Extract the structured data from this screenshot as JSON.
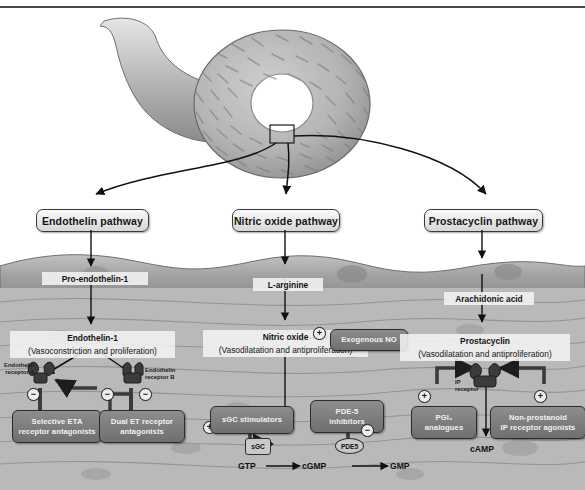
{
  "figure": {
    "vessel_label": "pulmonary artery cross-section"
  },
  "pathways": [
    {
      "id": "endothelin",
      "header": "Endothelin pathway",
      "precursor": "Pro-endothelin-1",
      "mediator_name": "Endothelin-1",
      "mediator_effect": "(Vasoconstriction and proliferation)",
      "receptors": [
        {
          "label_line1": "Endothelin",
          "label_line2": "receptor A"
        },
        {
          "label_line1": "Endothelin",
          "label_line2": "receptor B"
        }
      ],
      "drugs": [
        {
          "line1": "Selective ETA",
          "line2": "receptor antagonists",
          "sign": "−"
        },
        {
          "line1": "Dual ET receptor",
          "line2": "antagonists",
          "sign": "−"
        }
      ]
    },
    {
      "id": "nitric-oxide",
      "header": "Nitric oxide pathway",
      "precursor": "L-arginine",
      "mediator_name": "Nitric oxide",
      "mediator_effect": "(Vasodilatation and antiproliferation)",
      "exogenous": {
        "label": "Exogenous NO",
        "sign": "+"
      },
      "drugs": [
        {
          "line1": "sGC stimulators",
          "line2": "",
          "sign": "+"
        },
        {
          "line1": "PDE-5",
          "line2": "inhibitors",
          "sign": "−"
        }
      ],
      "enzymes": [
        {
          "label": "sGC"
        },
        {
          "label": "PDE5"
        }
      ],
      "cascade": [
        "GTP",
        "cGMP",
        "GMP"
      ]
    },
    {
      "id": "prostacyclin",
      "header": "Prostacyclin pathway",
      "precursor": "Arachidonic acid",
      "mediator_name": "Prostacyclin",
      "mediator_effect": "(Vasodilatation and antiproliferation)",
      "receptors": [
        {
          "label_line1": "IP",
          "label_line2": "receptor"
        }
      ],
      "drugs": [
        {
          "line1": "PGI₂",
          "line2": "analogues",
          "sign": "+"
        },
        {
          "line1": "Non-prostanoid",
          "line2": "IP receptor agonists",
          "sign": "+"
        }
      ],
      "second_messenger": "cAMP"
    }
  ],
  "colors": {
    "endothelium": "#9a9a9a",
    "smooth_muscle": "#b9b9b9",
    "drug_box": "#7d7d7d",
    "header_box": "#d6d6d6",
    "stroke": "#2c2c2c"
  }
}
